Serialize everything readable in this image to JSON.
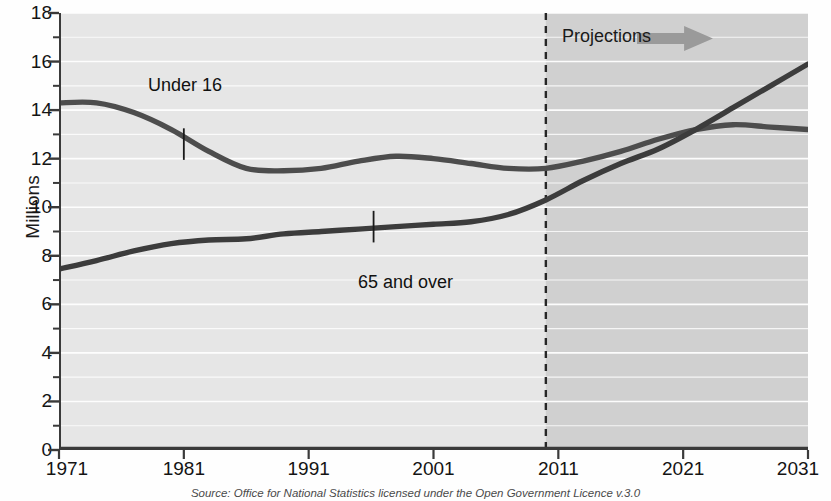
{
  "chart_data": {
    "type": "line",
    "title": "",
    "subtitle": "",
    "xlabel": "",
    "ylabel": "Millions",
    "xlim": [
      1971,
      2031
    ],
    "ylim": [
      0,
      18
    ],
    "y_major_step": 2,
    "y_minor_step": 1,
    "grid": "horizontal gridlines every 1 million (white)",
    "legend_position": "inline annotations on curves",
    "x_ticks": [
      "1971",
      "1981",
      "1991",
      "2001",
      "2011",
      "2021",
      "2031"
    ],
    "y_ticks": [
      "0",
      "2",
      "4",
      "6",
      "8",
      "10",
      "12",
      "14",
      "16",
      "18"
    ],
    "projection_start_year": 2010,
    "annotations": [
      {
        "text": "Under 16",
        "x": 1981,
        "y": 13.6
      },
      {
        "text": "65 and over",
        "x": 1996,
        "y": 8.0
      },
      {
        "text": "Projections",
        "x": 2013,
        "y": 17.1
      }
    ],
    "series": [
      {
        "name": "Under 16",
        "color": "#4d4d4d",
        "x": [
          1971,
          1974,
          1977,
          1980,
          1983,
          1986,
          1989,
          1992,
          1995,
          1998,
          2001,
          2004,
          2007,
          2010,
          2013,
          2016,
          2019,
          2022,
          2025,
          2028,
          2031
        ],
        "values": [
          14.3,
          14.3,
          13.9,
          13.2,
          12.3,
          11.6,
          11.5,
          11.6,
          11.9,
          12.1,
          12.0,
          11.8,
          11.6,
          11.6,
          11.9,
          12.3,
          12.8,
          13.2,
          13.4,
          13.3,
          13.2
        ]
      },
      {
        "name": "65 and over",
        "color": "#3c3c3c",
        "x": [
          1971,
          1974,
          1977,
          1980,
          1983,
          1986,
          1989,
          1992,
          1995,
          1998,
          2001,
          2004,
          2007,
          2010,
          2013,
          2016,
          2019,
          2022,
          2025,
          2028,
          2031
        ],
        "values": [
          7.45,
          7.8,
          8.2,
          8.5,
          8.65,
          8.7,
          8.9,
          9.0,
          9.1,
          9.2,
          9.3,
          9.4,
          9.7,
          10.3,
          11.1,
          11.8,
          12.4,
          13.2,
          14.1,
          15.0,
          15.9
        ]
      }
    ]
  },
  "colors": {
    "plot_background": "#e6e6e6",
    "projection_background": "#d0d0d0",
    "gridline": "#ffffff",
    "axis": "#3a3a3a",
    "series_line": "#4a4a4a",
    "arrow": "#9a9a9a",
    "text": "#141414"
  },
  "footer": {
    "source": "Source: Office for National Statistics licensed under the Open Government Licence v.3.0"
  }
}
